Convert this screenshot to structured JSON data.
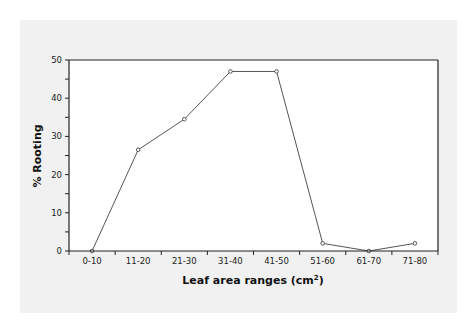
{
  "chart_data": {
    "type": "line",
    "title": "",
    "xlabel": "Leaf area ranges (cm",
    "xlabel_sup": "2",
    "xlabel_close": ")",
    "ylabel": "% Rooting",
    "categories": [
      "0-10",
      "11-20",
      "21-30",
      "31-40",
      "41-50",
      "51-60",
      "61-70",
      "71-80"
    ],
    "series": [
      {
        "name": "% Rooting",
        "values": [
          0,
          26.5,
          34.5,
          47,
          47,
          2,
          0,
          2
        ]
      }
    ],
    "ylim": [
      0,
      50
    ],
    "yticks": [
      0,
      10,
      20,
      30,
      40,
      50
    ],
    "grid": false,
    "legend": null,
    "colors": {
      "line": "#555555",
      "marker_fill": "#ffffff",
      "axis": "#222222",
      "panel": "#f1f1f1",
      "plot_bg": "#ffffff"
    }
  }
}
